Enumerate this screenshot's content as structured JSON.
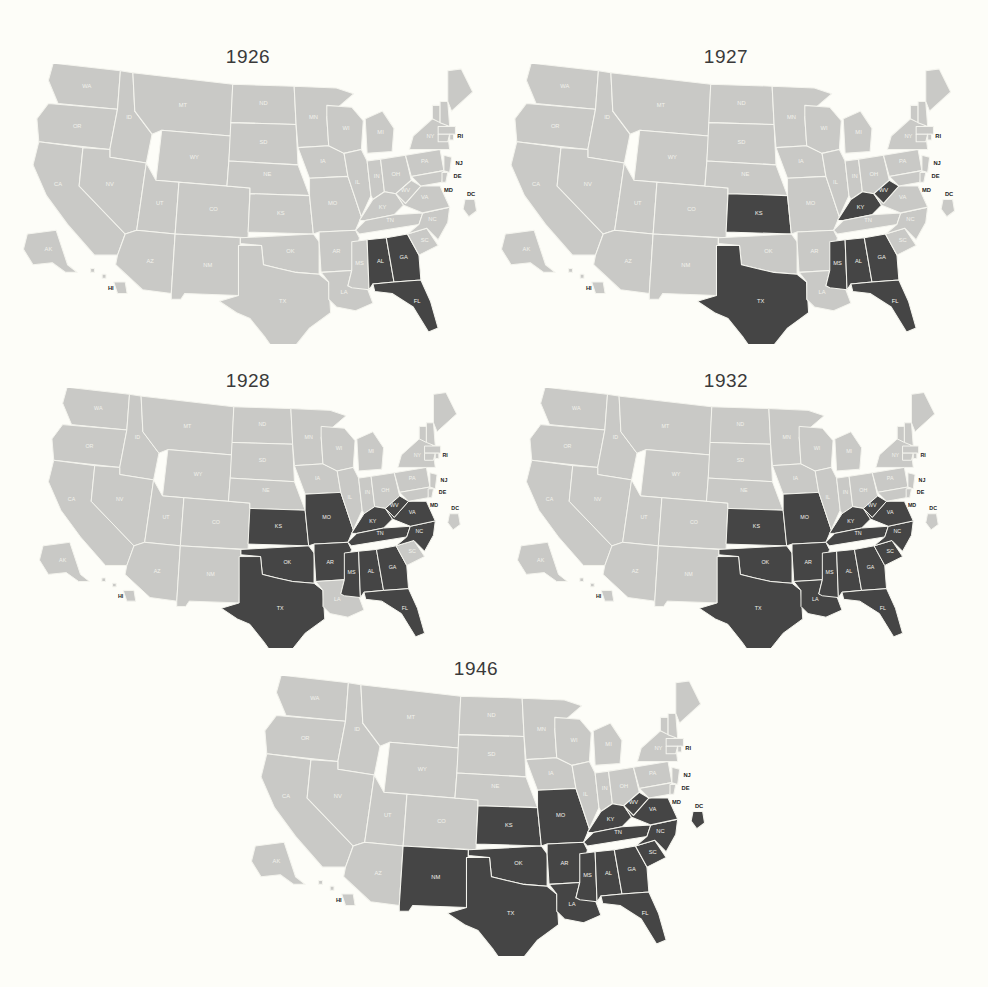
{
  "figure": {
    "colors": {
      "background": "#fdfdf8",
      "state_default": "#c9c9c6",
      "state_highlight": "#454545",
      "border": "#f4f4ee",
      "title": "#3a3a3a"
    }
  },
  "panels": [
    {
      "title": "1926",
      "highlighted": [
        "AL",
        "GA",
        "FL"
      ],
      "callouts": [
        "RI",
        "NJ",
        "DE",
        "MD",
        "DC",
        "HI"
      ]
    },
    {
      "title": "1927",
      "highlighted": [
        "KS",
        "TX",
        "KY",
        "WV",
        "MS",
        "AL",
        "GA",
        "FL"
      ],
      "callouts": [
        "RI",
        "NJ",
        "DE",
        "MD",
        "DC",
        "HI"
      ]
    },
    {
      "title": "1928",
      "highlighted": [
        "KS",
        "MO",
        "OK",
        "TX",
        "AR",
        "KY",
        "WV",
        "VA",
        "TN",
        "NC",
        "MS",
        "AL",
        "GA",
        "FL"
      ],
      "callouts": [
        "RI",
        "NJ",
        "DE",
        "MD",
        "DC",
        "HI"
      ]
    },
    {
      "title": "1932",
      "highlighted": [
        "KS",
        "MO",
        "OK",
        "TX",
        "AR",
        "LA",
        "KY",
        "WV",
        "VA",
        "TN",
        "NC",
        "SC",
        "MS",
        "AL",
        "GA",
        "FL"
      ],
      "callouts": [
        "RI",
        "NJ",
        "DE",
        "MD",
        "DC",
        "HI"
      ]
    },
    {
      "title": "1946",
      "highlighted": [
        "NM",
        "KS",
        "MO",
        "OK",
        "TX",
        "AR",
        "LA",
        "KY",
        "WV",
        "VA",
        "TN",
        "NC",
        "SC",
        "MS",
        "AL",
        "GA",
        "FL",
        "DC"
      ],
      "callouts": [
        "RI",
        "NJ",
        "DE",
        "MD",
        "DC",
        "HI"
      ]
    }
  ],
  "chart_data": [
    {
      "type": "choropleth",
      "title": "1926",
      "highlighted_states": [
        "AL",
        "GA",
        "FL"
      ]
    },
    {
      "type": "choropleth",
      "title": "1927",
      "highlighted_states": [
        "KS",
        "TX",
        "KY",
        "WV",
        "MS",
        "AL",
        "GA",
        "FL"
      ]
    },
    {
      "type": "choropleth",
      "title": "1928",
      "highlighted_states": [
        "KS",
        "MO",
        "OK",
        "TX",
        "AR",
        "KY",
        "WV",
        "VA",
        "TN",
        "NC",
        "MS",
        "AL",
        "GA",
        "FL"
      ]
    },
    {
      "type": "choropleth",
      "title": "1932",
      "highlighted_states": [
        "KS",
        "MO",
        "OK",
        "TX",
        "AR",
        "LA",
        "KY",
        "WV",
        "VA",
        "TN",
        "NC",
        "SC",
        "MS",
        "AL",
        "GA",
        "FL"
      ]
    },
    {
      "type": "choropleth",
      "title": "1946",
      "highlighted_states": [
        "NM",
        "KS",
        "MO",
        "OK",
        "TX",
        "AR",
        "LA",
        "KY",
        "WV",
        "VA",
        "TN",
        "NC",
        "SC",
        "MS",
        "AL",
        "GA",
        "FL",
        "DC"
      ]
    }
  ]
}
